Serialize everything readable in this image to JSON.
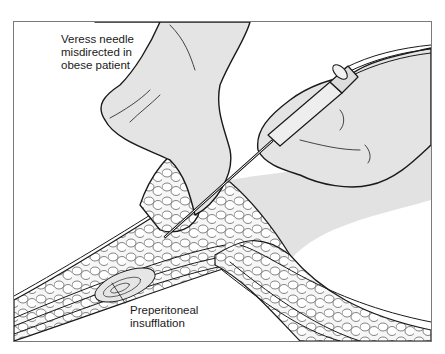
{
  "figure": {
    "title": "Veress needle misdirected in obese patient",
    "labels": {
      "veress": {
        "line1": "Veress needle",
        "line2": "misdirected in",
        "line3": "obese patient"
      },
      "preperitoneal": {
        "line1": "Preperitoneal",
        "line2": "insufflation"
      }
    },
    "elements": [
      "left-hand",
      "right-hand",
      "syringe",
      "veress-needle",
      "abdominal-wall",
      "fat-layer",
      "insufflation-pocket"
    ],
    "colors": {
      "line": "#1a1a1a",
      "skin_fill": "#e4e4e4",
      "fat_fill": "#f4f4f4",
      "frame": "#7a7a7a",
      "background": "#ffffff"
    }
  }
}
